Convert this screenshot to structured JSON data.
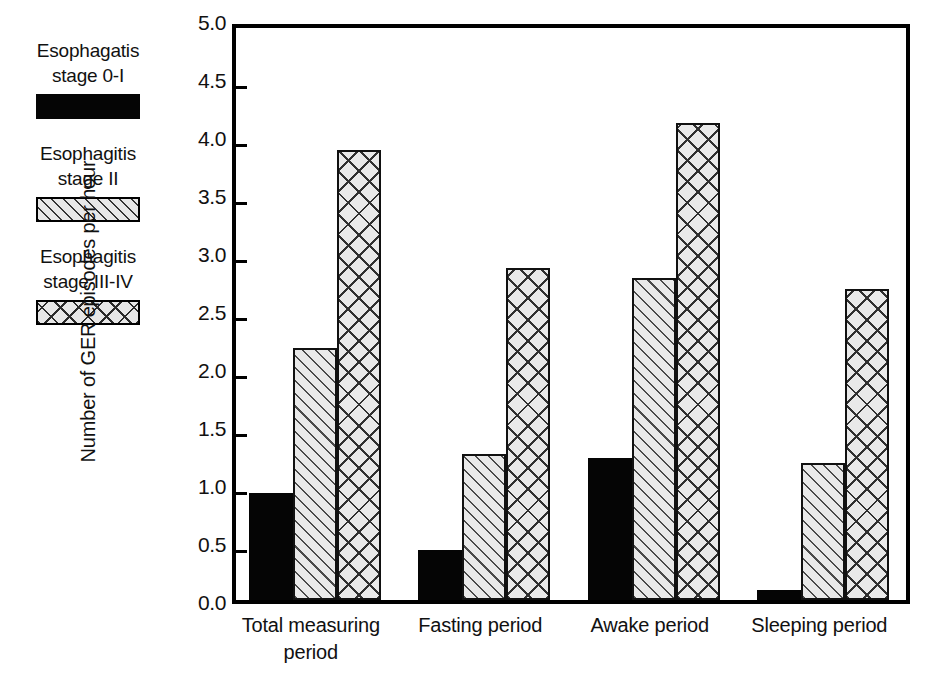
{
  "chart_data": {
    "type": "bar",
    "title": "",
    "xlabel": "",
    "ylabel": "Number of GER episodes per hour",
    "ylim": [
      0.0,
      5.0
    ],
    "ytick_step": 0.5,
    "grid": false,
    "legend_position": "outside-left-top",
    "categories": [
      "Total measuring\nperiod",
      "Fasting period",
      "Awake period",
      "Sleeping period"
    ],
    "ytick_labels": [
      "5.0",
      "4.5",
      "4.0",
      "3.5",
      "3.0",
      "2.5",
      "2.0",
      "1.5",
      "1.0",
      "0.5",
      "0.0"
    ],
    "series": [
      {
        "name": "Esophagatis\nstage 0-I",
        "pattern": "solid-black",
        "color": "#050505",
        "values": [
          0.92,
          0.43,
          1.22,
          0.09
        ]
      },
      {
        "name": "Esophagitis\nstage II",
        "pattern": "diagonal-hatch",
        "color": "#e9e9e9",
        "values": [
          2.17,
          1.26,
          2.78,
          1.18
        ]
      },
      {
        "name": "Esophagitis\nstage III-IV",
        "pattern": "cross-hatch",
        "color": "#e9e9e9",
        "values": [
          3.88,
          2.86,
          4.11,
          2.68
        ]
      }
    ]
  }
}
